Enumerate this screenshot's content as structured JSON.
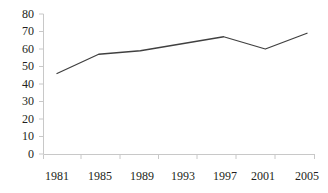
{
  "chart_data": {
    "type": "line",
    "title": "",
    "subtitle": "",
    "xlabel": "",
    "ylabel": "",
    "x": [
      1981,
      1985,
      1989,
      1993,
      1997,
      2001,
      2005
    ],
    "categories": [
      "1981",
      "1985",
      "1989",
      "1993",
      "1997",
      "2001",
      "2005"
    ],
    "values": [
      46,
      57,
      59,
      63,
      67,
      60,
      69
    ],
    "series": [
      {
        "name": "",
        "values": [
          46,
          57,
          59,
          63,
          67,
          60,
          69
        ]
      }
    ],
    "xlim": [
      1981,
      2005
    ],
    "ylim": [
      0,
      80
    ],
    "yticks": [
      0,
      10,
      20,
      30,
      40,
      50,
      60,
      70,
      80
    ],
    "ytick_labels": [
      "0",
      "10",
      "20",
      "30",
      "40",
      "50",
      "60",
      "70",
      "80"
    ],
    "xtick_labels": [
      "1981",
      "1985",
      "1989",
      "1993",
      "1997",
      "2001",
      "2005"
    ],
    "grid": false,
    "legend": null,
    "legend_position": "none",
    "annotations": [],
    "colors": {
      "line": "#404040",
      "axis": "#c8c8c8",
      "text": "#231f20",
      "background": "#ffffff"
    }
  },
  "axes": {
    "y_labels": [
      {
        "text": "80",
        "top": 8
      },
      {
        "text": "70",
        "top": 25
      },
      {
        "text": "60",
        "top": 43
      },
      {
        "text": "50",
        "top": 60
      },
      {
        "text": "40",
        "top": 78
      },
      {
        "text": "30",
        "top": 95
      },
      {
        "text": "20",
        "top": 113
      },
      {
        "text": "10",
        "top": 130
      },
      {
        "text": "0",
        "top": 148
      }
    ],
    "x_labels": [
      {
        "text": "1981",
        "left": 37
      },
      {
        "text": "1985",
        "left": 80
      },
      {
        "text": "1989",
        "left": 122
      },
      {
        "text": "1993",
        "left": 163
      },
      {
        "text": "1997",
        "left": 205
      },
      {
        "text": "2001",
        "left": 243
      },
      {
        "text": "2005",
        "left": 287
      }
    ]
  }
}
